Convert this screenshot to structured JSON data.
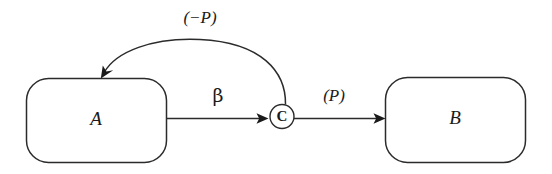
{
  "diagram": {
    "type": "flow-diagram",
    "background_color": "#ffffff",
    "stroke_color": "#2b2b2b",
    "nodes": [
      {
        "id": "A",
        "label": "A",
        "shape": "rounded-rectangle"
      },
      {
        "id": "C",
        "label": "C",
        "shape": "circle"
      },
      {
        "id": "B",
        "label": "B",
        "shape": "rounded-rectangle"
      }
    ],
    "edges": [
      {
        "id": "a-to-c",
        "from": "A",
        "to": "C",
        "label": "β",
        "style": "straight-arrow"
      },
      {
        "id": "c-to-b",
        "from": "C",
        "to": "B",
        "label": "(P)",
        "style": "straight-arrow"
      },
      {
        "id": "c-to-a",
        "from": "C",
        "to": "A",
        "label": "(−P)",
        "style": "curved-arrow"
      }
    ]
  }
}
